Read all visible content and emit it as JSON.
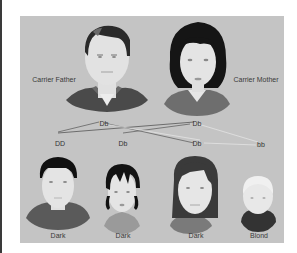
{
  "diagram": {
    "parents": [
      {
        "id": "father",
        "label": "Carrier Father",
        "genotype": "Db"
      },
      {
        "id": "mother",
        "label": "Carrier Mother",
        "genotype": "Db"
      }
    ],
    "offspring": [
      {
        "id": "child1",
        "genotype": "DD",
        "phenotype": "Dark"
      },
      {
        "id": "child2",
        "genotype": "Db",
        "phenotype": "Dark"
      },
      {
        "id": "child3",
        "genotype": "Db",
        "phenotype": "Dark"
      },
      {
        "id": "child4",
        "genotype": "bb",
        "phenotype": "Blond"
      }
    ],
    "colors": {
      "panel": "#c4c4c4",
      "line_dark": "#555555",
      "line_light": "#e8e8e8",
      "skin": "#e2e2e2",
      "hair_dark": "#1a1a1a",
      "hair_blond": "#e6e6e6"
    }
  }
}
